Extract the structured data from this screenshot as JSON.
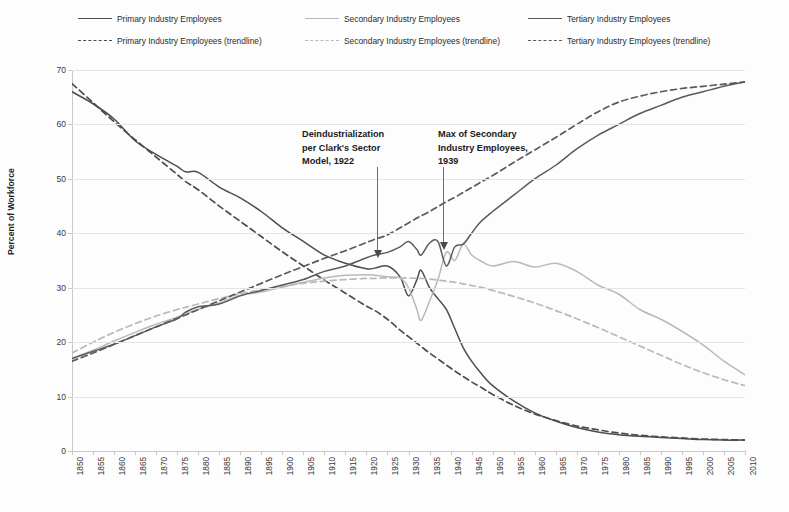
{
  "legend": {
    "entries": [
      {
        "label": "Primary Industry Employees",
        "style": "solid",
        "color": "#4d4d4d",
        "col": 0,
        "row": 0
      },
      {
        "label": "Primary Industry Employees (trendline)",
        "style": "dashed",
        "color": "#4d4d4d",
        "col": 0,
        "row": 1
      },
      {
        "label": "Secondary Industry Employees",
        "style": "solid",
        "color": "#b9b9b9",
        "col": 1,
        "row": 0
      },
      {
        "label": "Secondary Industry Employees (trendline)",
        "style": "dashed",
        "color": "#b9b9b9",
        "col": 1,
        "row": 1
      },
      {
        "label": "Tertiary Industry Employees",
        "style": "solid",
        "color": "#5a5a5a",
        "col": 2,
        "row": 0
      },
      {
        "label": "Tertiary Industry Employees (trendline)",
        "style": "dashed",
        "color": "#5a5a5a",
        "col": 2,
        "row": 1
      }
    ]
  },
  "annotations": [
    {
      "name": "deindustrialization-note",
      "text": "Deindustrialization\nper Clark's Sector\nModel, 1922",
      "x": 302,
      "y": 128,
      "arrow_x": 377,
      "arrow_top": 167,
      "arrow_len": 84
    },
    {
      "name": "max-secondary-note",
      "text": "Max of Secondary\nIndustry Employees,\n1939",
      "x": 438,
      "y": 128,
      "arrow_x": 443,
      "arrow_top": 167,
      "arrow_len": 76
    }
  ],
  "chart_data": {
    "type": "line",
    "title": "",
    "xlabel": "",
    "ylabel": "Percent of Workforce",
    "xlim": [
      1850,
      2010
    ],
    "ylim": [
      0,
      70
    ],
    "yticks": [
      0,
      10,
      20,
      30,
      40,
      50,
      60,
      70
    ],
    "xticks": [
      1850,
      1855,
      1860,
      1865,
      1870,
      1875,
      1880,
      1885,
      1890,
      1895,
      1900,
      1905,
      1910,
      1915,
      1920,
      1925,
      1930,
      1935,
      1940,
      1945,
      1950,
      1955,
      1960,
      1965,
      1970,
      1975,
      1980,
      1985,
      1990,
      1995,
      2000,
      2005,
      2010
    ],
    "grid": true,
    "legend_position": "top",
    "x": [
      1850,
      1855,
      1860,
      1865,
      1870,
      1875,
      1877,
      1880,
      1885,
      1890,
      1895,
      1900,
      1905,
      1910,
      1915,
      1920,
      1922,
      1925,
      1928,
      1930,
      1932,
      1933,
      1935,
      1937,
      1939,
      1941,
      1943,
      1945,
      1947,
      1950,
      1955,
      1960,
      1965,
      1970,
      1975,
      1980,
      1985,
      1990,
      1995,
      2000,
      2005,
      2010
    ],
    "series": [
      {
        "name": "Primary Industry Employees",
        "style": "solid",
        "color": "#4d4d4d",
        "values": [
          66.0,
          63.8,
          61.0,
          57.0,
          54.5,
          52.3,
          51.3,
          51.2,
          48.5,
          46.5,
          44.0,
          41.0,
          38.5,
          36.0,
          34.5,
          33.5,
          33.6,
          34.0,
          32.0,
          28.5,
          31.5,
          33.2,
          30.0,
          28.0,
          26.0,
          22.5,
          19.0,
          16.5,
          14.5,
          12.0,
          9.2,
          7.0,
          5.5,
          4.3,
          3.5,
          3.0,
          2.7,
          2.5,
          2.3,
          2.1,
          2.0,
          2.0
        ]
      },
      {
        "name": "Primary Industry Employees (trendline)",
        "style": "dashed",
        "color": "#4d4d4d",
        "values": [
          67.5,
          64.0,
          60.5,
          57.2,
          54.0,
          50.8,
          49.5,
          48.0,
          45.0,
          42.2,
          39.4,
          36.6,
          34.0,
          31.4,
          29.0,
          26.6,
          25.8,
          24.2,
          22.2,
          21.0,
          19.8,
          19.2,
          18.0,
          16.9,
          15.8,
          14.7,
          13.7,
          12.7,
          11.8,
          10.4,
          8.4,
          6.8,
          5.6,
          4.6,
          3.9,
          3.3,
          2.9,
          2.6,
          2.4,
          2.2,
          2.1,
          2.0
        ]
      },
      {
        "name": "Secondary Industry Employees",
        "style": "solid",
        "color": "#b9b9b9",
        "values": [
          17.0,
          18.5,
          20.2,
          21.8,
          23.3,
          24.6,
          25.2,
          26.0,
          27.2,
          28.6,
          29.2,
          30.1,
          31.0,
          31.8,
          32.3,
          32.4,
          32.3,
          32.0,
          31.8,
          30.0,
          26.0,
          24.0,
          27.5,
          31.5,
          36.5,
          35.0,
          38.0,
          36.0,
          35.0,
          34.0,
          34.8,
          33.8,
          34.5,
          33.0,
          30.5,
          28.8,
          26.0,
          24.2,
          22.0,
          19.5,
          16.5,
          14.0
        ]
      },
      {
        "name": "Secondary Industry Employees (trendline)",
        "style": "dashed",
        "color": "#b9b9b9",
        "values": [
          18.0,
          20.0,
          21.8,
          23.4,
          24.8,
          26.0,
          26.4,
          27.0,
          28.0,
          28.9,
          29.6,
          30.3,
          30.8,
          31.2,
          31.5,
          31.7,
          31.7,
          31.8,
          31.8,
          31.8,
          31.7,
          31.7,
          31.6,
          31.4,
          31.2,
          31.0,
          30.7,
          30.4,
          30.1,
          29.5,
          28.4,
          27.2,
          25.8,
          24.3,
          22.7,
          21.0,
          19.3,
          17.6,
          15.9,
          14.4,
          13.1,
          12.0
        ]
      },
      {
        "name": "Tertiary Industry Employees",
        "style": "solid",
        "color": "#5a5a5a",
        "values": [
          17.0,
          18.3,
          19.6,
          21.2,
          22.8,
          24.3,
          25.5,
          26.5,
          27.0,
          28.5,
          29.5,
          30.5,
          31.5,
          33.0,
          34.0,
          35.5,
          36.0,
          36.5,
          37.5,
          38.5,
          37.0,
          36.0,
          38.2,
          38.5,
          34.0,
          37.5,
          38.0,
          40.0,
          42.0,
          44.0,
          47.0,
          50.0,
          52.5,
          55.5,
          58.0,
          60.0,
          62.0,
          63.5,
          65.0,
          66.0,
          67.0,
          67.8
        ]
      },
      {
        "name": "Tertiary Industry Employees (trendline)",
        "style": "dashed",
        "color": "#5a5a5a",
        "values": [
          16.5,
          18.0,
          19.6,
          21.2,
          22.8,
          24.4,
          25.0,
          26.0,
          27.6,
          29.2,
          30.8,
          32.4,
          33.9,
          35.4,
          36.8,
          38.3,
          38.9,
          39.7,
          41.0,
          41.9,
          42.8,
          43.2,
          44.0,
          44.9,
          45.8,
          46.6,
          47.5,
          48.4,
          49.3,
          50.6,
          53.0,
          55.3,
          57.6,
          60.0,
          62.3,
          64.1,
          65.2,
          66.0,
          66.6,
          67.0,
          67.4,
          67.8
        ]
      }
    ]
  }
}
